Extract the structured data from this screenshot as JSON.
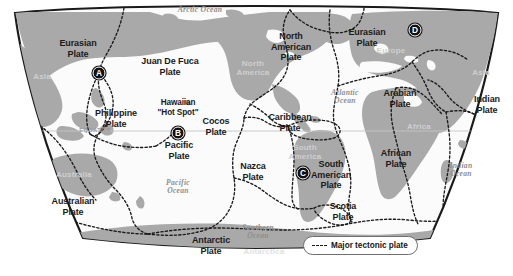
{
  "figure": {
    "background_color": "#ffffff",
    "land_color": "#a9a9a9",
    "ocean_color": "#fbfbfb",
    "border_color": "#1a1a1a",
    "plate_boundary_color": "#1a1a1a"
  },
  "legend": {
    "label": "Major tectonic plate",
    "swatch": "dashed-line-swatch"
  },
  "equator": {
    "label": "EQUATOR"
  },
  "plates": [
    {
      "id": "eurasian-west",
      "name": "Eurasian\nPlate",
      "line1": "Eurasian",
      "line2": "Plate",
      "x": 78,
      "y": 48
    },
    {
      "id": "juan-de-fuca",
      "name": "Juan De Fuca Plate",
      "line1": "Juan De Fuca",
      "line2": "Plate",
      "x": 170,
      "y": 66
    },
    {
      "id": "north-american",
      "name": "North American Plate",
      "line1": "North",
      "line2": "American",
      "line3": "Plate",
      "x": 291,
      "y": 47
    },
    {
      "id": "eurasian-east",
      "name": "Eurasian Plate",
      "line1": "Eurasian",
      "line2": "Plate",
      "x": 367,
      "y": 37
    },
    {
      "id": "philippine",
      "name": "Philippine Plate",
      "line1": "Philippine",
      "line2": "Plate",
      "x": 116,
      "y": 118
    },
    {
      "id": "hawaiian-hot-spot",
      "name": "Hawaiian \"Hot Spot\"",
      "line1": "Hawaiian",
      "line2": "\"Hot Spot\"",
      "x": 178,
      "y": 108
    },
    {
      "id": "cocos",
      "name": "Cocos Plate",
      "line1": "Cocos",
      "line2": "Plate",
      "x": 216,
      "y": 126
    },
    {
      "id": "caribbean",
      "name": "Caribbean Plate",
      "line1": "Caribbean",
      "line2": "Plate",
      "x": 290,
      "y": 122
    },
    {
      "id": "arabian",
      "name": "Arabian Plate",
      "line1": "Arabian",
      "line2": "Plate",
      "x": 400,
      "y": 98
    },
    {
      "id": "indian",
      "name": "Indian Plate",
      "line1": "Indian",
      "line2": "Plate",
      "x": 487,
      "y": 104
    },
    {
      "id": "pacific",
      "name": "Pacific Plate",
      "line1": "Pacific",
      "line2": "Plate",
      "x": 179,
      "y": 150
    },
    {
      "id": "nazca",
      "name": "Nazca Plate",
      "line1": "Nazca",
      "line2": "Plate",
      "x": 253,
      "y": 171
    },
    {
      "id": "south-american",
      "name": "South American Plate",
      "line1": "South",
      "line2": "American",
      "line3": "Plate",
      "x": 331,
      "y": 175
    },
    {
      "id": "african",
      "name": "African Plate",
      "line1": "African",
      "line2": "Plate",
      "x": 396,
      "y": 158
    },
    {
      "id": "scotia",
      "name": "Scotia Plate",
      "line1": "Scotia",
      "line2": "Plate",
      "x": 343,
      "y": 211
    },
    {
      "id": "australian",
      "name": "Australian Plate",
      "line1": "Australian",
      "line2": "Plate",
      "x": 73,
      "y": 206
    },
    {
      "id": "antarctic",
      "name": "Antarctic Plate",
      "line1": "Antarctic",
      "line2": "Plate",
      "x": 211,
      "y": 245
    }
  ],
  "oceans": [
    {
      "id": "arctic-ocean",
      "label": "Arctic Ocean",
      "x": 200,
      "y": 10,
      "lines": [
        "Arctic Ocean"
      ]
    },
    {
      "id": "atlantic-ocean",
      "label": "Atlantic Ocean",
      "x": 345,
      "y": 97,
      "lines": [
        "Atlantic",
        "Ocean"
      ]
    },
    {
      "id": "pacific-ocean",
      "label": "Pacific Ocean",
      "x": 178,
      "y": 187,
      "lines": [
        "Pacific",
        "Ocean"
      ]
    },
    {
      "id": "indian-ocean",
      "label": "Indian Ocean",
      "x": 461,
      "y": 170,
      "lines": [
        "Indian",
        "Ocean"
      ]
    },
    {
      "id": "southern-ocean",
      "label": "Southern Ocean",
      "x": 258,
      "y": 232,
      "lines": [
        "Southern",
        "Ocean"
      ]
    }
  ],
  "continents": [
    {
      "id": "asia-west",
      "label": "Asia",
      "x": 42,
      "y": 76
    },
    {
      "id": "australia",
      "label": "Australia",
      "x": 74,
      "y": 174
    },
    {
      "id": "north-america",
      "label": "North\nAmerica",
      "lines": [
        "North",
        "America"
      ],
      "x": 253,
      "y": 68
    },
    {
      "id": "south-america",
      "label": "South\nAmerica",
      "lines": [
        "South",
        "America"
      ],
      "x": 305,
      "y": 152
    },
    {
      "id": "europe",
      "label": "Europe",
      "x": 391,
      "y": 50
    },
    {
      "id": "africa",
      "label": "Africa",
      "x": 419,
      "y": 126
    },
    {
      "id": "asia-east",
      "label": "Asia",
      "x": 481,
      "y": 72
    },
    {
      "id": "antarctica",
      "label": "Antarctica",
      "x": 264,
      "y": 251
    }
  ],
  "markers": [
    {
      "id": "marker-a",
      "letter": "A",
      "x": 99,
      "y": 73
    },
    {
      "id": "marker-b",
      "letter": "B",
      "x": 178,
      "y": 133
    },
    {
      "id": "marker-c",
      "letter": "C",
      "x": 303,
      "y": 173
    },
    {
      "id": "marker-d",
      "letter": "D",
      "x": 415,
      "y": 30
    }
  ]
}
